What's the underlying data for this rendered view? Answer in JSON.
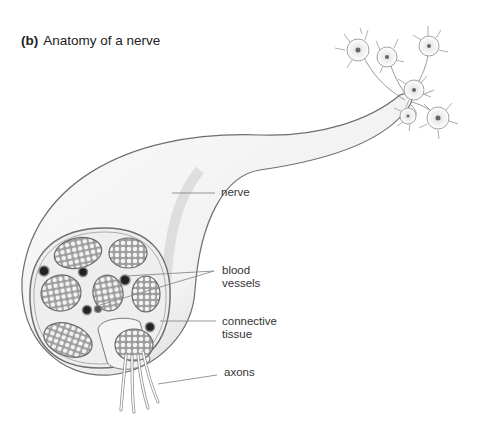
{
  "figure": {
    "panel_letter": "(b)",
    "title": "Anatomy of a nerve"
  },
  "labels": {
    "nerve": "nerve",
    "blood_vessels_line1": "blood",
    "blood_vessels_line2": "vessels",
    "connective_tissue_line1": "connective",
    "connective_tissue_line2": "tissue",
    "axons": "axons"
  },
  "colors": {
    "background": "#ffffff",
    "outline": "#6e6e6e",
    "shading": "#bdbdbd",
    "bundle_fill": "#a8a8a8",
    "vessel": "#222222",
    "leader_line": "#8a8a8a"
  }
}
